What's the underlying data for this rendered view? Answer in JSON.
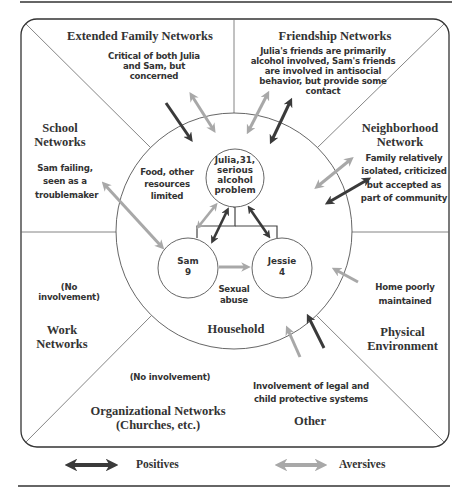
{
  "sectors": {
    "extended_family": {
      "title": "Extended Family Networks",
      "note": "Critical of both Julia and Sam, but concerned"
    },
    "friendship": {
      "title": "Friendship Networks",
      "note": "Julia's friends are primarily alcohol involved, Sam's friends are involved in antisocial behavior, but provide some contact"
    },
    "school": {
      "title": "School Networks",
      "note": "Sam failing, seen as a troublemaker"
    },
    "neighborhood": {
      "title": "Neighborhood Network",
      "note": "Family relatively isolated, criticized but accepted as part of community"
    },
    "work": {
      "title": "Work Networks",
      "note": "(No involvement)"
    },
    "physical": {
      "title": "Physical Environment",
      "note": "Home poorly maintained"
    },
    "organizational": {
      "title": "Organizational Networks (Churches, etc.)",
      "note": "(No involvement)"
    },
    "other": {
      "title": "Other",
      "note": "Involvement of legal and child protective systems"
    }
  },
  "household": {
    "label": "Household",
    "resources_note": "Food, other resources limited",
    "julia": {
      "line1": "Julia,31,",
      "line2": "serious",
      "line3": "alcohol",
      "line4": "problem"
    },
    "sam": {
      "line1": "Sam",
      "line2": "9"
    },
    "jessie": {
      "line1": "Jessie",
      "line2": "4"
    },
    "sam_to_jessie_note": "Sexual abuse"
  },
  "legend": {
    "positives": {
      "label": "Positives",
      "color": "#3a3a3a"
    },
    "aversives": {
      "label": "Aversives",
      "color": "#a8a8a8"
    }
  },
  "colors": {
    "positive": "#3a3a3a",
    "aversive": "#a8a8a8",
    "line": "#555555"
  }
}
